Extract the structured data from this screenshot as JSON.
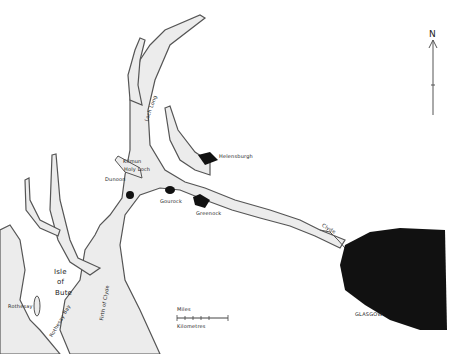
{
  "map": {
    "type": "hand-drawn sketch map",
    "colors": {
      "water": "#ececec",
      "coast": "#555555",
      "urban": "#111111",
      "land": "#ffffff"
    },
    "places": {
      "loch_long": "Loch Long",
      "kilmun": "Kilmun",
      "holy_loch": "Holy Loch",
      "dunoon": "Dunoon",
      "helensburgh": "Helensburgh",
      "gourock": "Gourock",
      "greenock": "Greenock",
      "clyde": "Clyde",
      "glasgow": "GLASGOW",
      "isle_of_bute_1": "Isle",
      "isle_of_bute_2": "of",
      "isle_of_bute_3": "Bute",
      "rothesay": "Rothesay",
      "rothesay_bay": "Rothesay Bay",
      "firth_of_clyde": "Firth of Clyde"
    },
    "scale": {
      "miles_label": "Miles",
      "km_label": "Kilometres"
    },
    "north_arrow": {
      "label": "N"
    }
  }
}
